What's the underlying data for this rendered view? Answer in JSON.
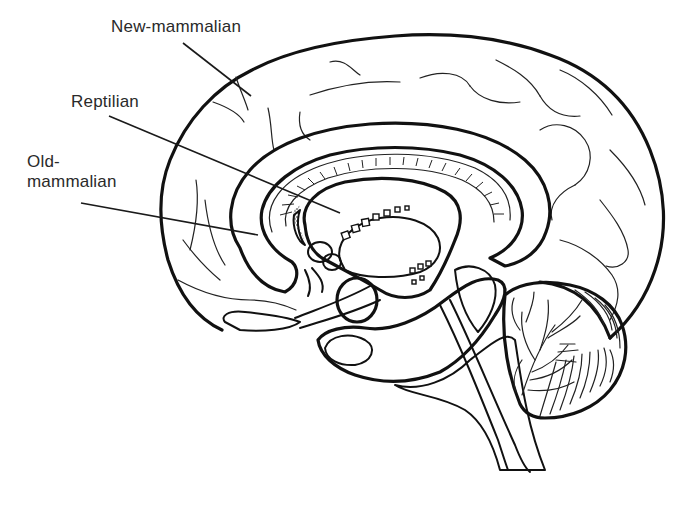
{
  "diagram": {
    "labels": [
      {
        "id": "new-mammalian",
        "text": "New-mammalian",
        "target": "neocortex"
      },
      {
        "id": "reptilian",
        "text": "Reptilian",
        "target": "brainstem-basal-ganglia"
      },
      {
        "id": "old-mammalian",
        "text": "Old-\nmammalian",
        "target": "limbic-system"
      }
    ],
    "leader_lines": [
      {
        "label": "new-mammalian",
        "x1": 183,
        "y1": 43,
        "x2": 251,
        "y2": 96
      },
      {
        "label": "reptilian",
        "x1": 109,
        "y1": 116,
        "x2": 340,
        "y2": 213
      },
      {
        "label": "old-mammalian",
        "x1": 81,
        "y1": 203,
        "x2": 258,
        "y2": 235
      }
    ],
    "regions": [
      "cerebral-cortex-outline",
      "cortical-sulci",
      "limbic-cingulate-band",
      "corpus-callosum",
      "thalamus",
      "hypothalamus",
      "pituitary",
      "midbrain",
      "pons",
      "medulla",
      "cerebellum",
      "arbor-vitae"
    ],
    "colors": {
      "ink": "#111111",
      "label_text": "#2a2a2a",
      "background": "#ffffff"
    }
  }
}
